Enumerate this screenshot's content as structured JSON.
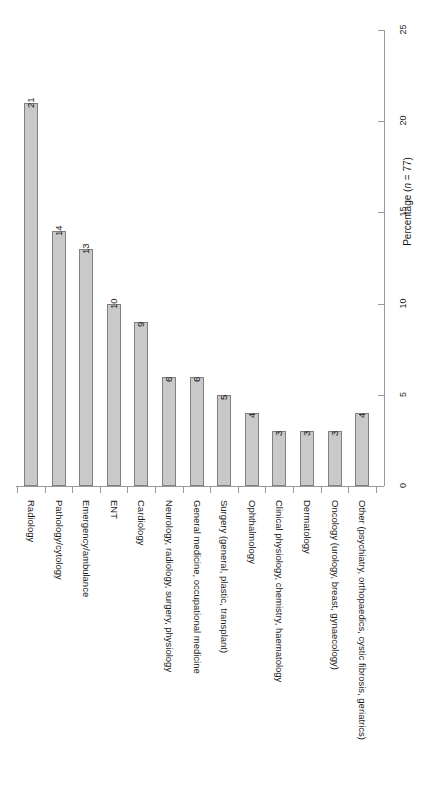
{
  "chart_data": {
    "type": "bar",
    "orientation": "vertical-bars-rotated-page",
    "title": "",
    "xlabel": "",
    "ylabel": "Percentage (n = 77)",
    "ylabel_parts": {
      "prefix": "Percentage (",
      "italic": "n",
      "suffix": " = 77)"
    },
    "ylim": [
      0,
      25
    ],
    "yticks": [
      0,
      5,
      10,
      15,
      20,
      25
    ],
    "ytick_labels": [
      "0",
      "5",
      "10",
      "15",
      "20",
      "25"
    ],
    "grid": false,
    "legend": false,
    "n": 77,
    "bar_fill_color": "#c9c9c9",
    "bar_border_color": "#808080",
    "axis_color": "#9a9a9a",
    "categories": [
      "Radiology",
      "Pathology/cytology",
      "Emergency/ambulance",
      "ENT",
      "Cardiology",
      "Neurology, radiology, surgery, physiology",
      "General medicine, occupational medicine",
      "Surgery (general, plastic, transplant)",
      "Ophthalmology",
      "Clinical physiology, chemistry, haematology",
      "Dermatology",
      "Oncology (urology, breast, gynaecology)",
      "Other (psychiatry, orthopaedics, cystic fibrosis, geriatrics)"
    ],
    "values": [
      21,
      14,
      13,
      10,
      9,
      6,
      6,
      5,
      4,
      3,
      3,
      3,
      4
    ],
    "value_labels": [
      "21",
      "14",
      "13",
      "10",
      "9",
      "6",
      "6",
      "5",
      "4",
      "3",
      "3",
      "3",
      "4"
    ]
  }
}
